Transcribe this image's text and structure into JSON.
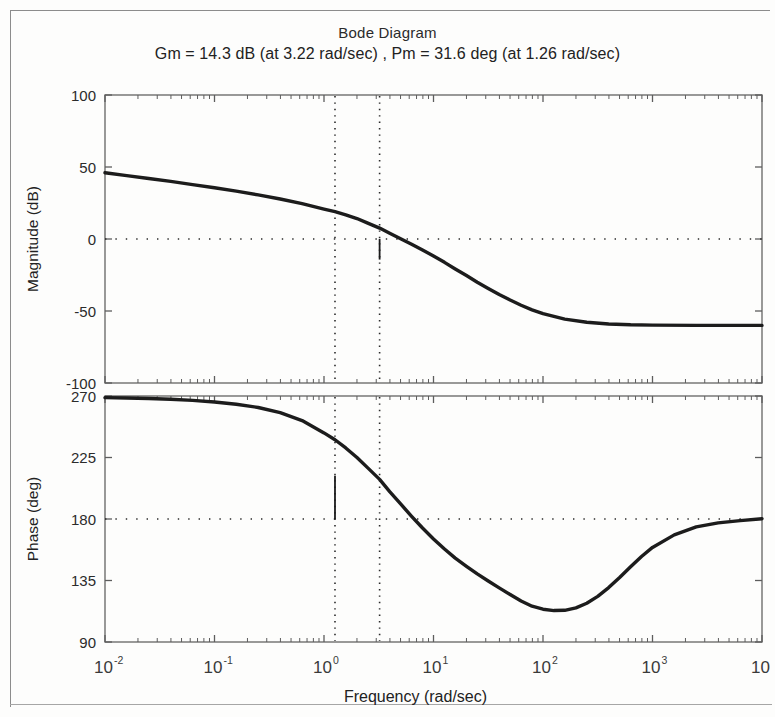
{
  "figure": {
    "title": "Bode Diagram",
    "subtitle": "Gm = 14.3 dB (at 3.22 rad/sec) ,  Pm = 31.6 deg (at 1.26 rad/sec)"
  },
  "margins": {
    "gain_margin_db": 14.3,
    "gain_margin_freq": 3.22,
    "phase_margin_deg": 31.6,
    "phase_margin_freq": 1.26,
    "gain_margin_label": "Gm = 14.3 dB (at 3.22 rad/sec)",
    "phase_margin_label": "Pm = 31.6 deg (at 1.26 rad/sec)"
  },
  "xaxis": {
    "label": "Frequency  (rad/sec)",
    "scale": "log",
    "range": [
      0.01,
      10000
    ],
    "tick_bases": [
      "10",
      "10",
      "10",
      "10",
      "10",
      "10",
      "10"
    ],
    "tick_exponents": [
      "-2",
      "-1",
      "0",
      "1",
      "2",
      "3",
      ""
    ],
    "tick_values": [
      0.01,
      0.1,
      1,
      10,
      100,
      1000,
      10000
    ]
  },
  "chart_data": {
    "type": "line",
    "title": "Bode Diagram",
    "subtitle": "Gm = 14.3 dB (at 3.22 rad/sec) ,  Pm = 31.6 deg (at 1.26 rad/sec)",
    "xlabel": "Frequency  (rad/sec)",
    "xscale": "log",
    "xlim": [
      0.01,
      10000
    ],
    "xticks": [
      0.01,
      0.1,
      1,
      10,
      100,
      1000,
      10000
    ],
    "grid": false,
    "legend": null,
    "panels": [
      {
        "name": "magnitude",
        "ylabel": "Magnitude (dB)",
        "ylim": [
          -100,
          100
        ],
        "yticks": [
          -100,
          -50,
          0,
          50,
          100
        ],
        "ytick_labels": [
          "-100",
          "-50",
          "0",
          "50",
          "100"
        ],
        "reference_line": {
          "y": 0,
          "style": "dotted"
        },
        "markers": [
          {
            "kind": "vertical-dotted",
            "x": 1.26,
            "note": "gain crossover (Pm freq)"
          },
          {
            "kind": "vertical-dotted",
            "x": 3.22,
            "note": "phase crossover (Gm freq)"
          },
          {
            "kind": "vertical-solid",
            "x": 3.22,
            "from": 0,
            "to": -14.3,
            "note": "gain margin bar"
          }
        ],
        "series": [
          {
            "name": "magnitude",
            "x": [
              0.01,
              0.0158,
              0.0251,
              0.0398,
              0.0631,
              0.1,
              0.158,
              0.251,
              0.398,
              0.631,
              1.0,
              1.26,
              1.58,
              2.0,
              2.51,
              3.22,
              3.98,
              5.01,
              6.31,
              7.94,
              10.0,
              12.6,
              15.8,
              20.0,
              25.1,
              31.6,
              39.8,
              50.1,
              63.1,
              79.4,
              100,
              158,
              251,
              398,
              631,
              1000,
              2510,
              10000
            ],
            "y": [
              46.0,
              44.0,
              42.0,
              40.0,
              37.8,
              35.6,
              33.2,
              30.6,
              27.8,
              24.6,
              20.8,
              19.0,
              16.8,
              14.2,
              11.0,
              7.6,
              4.0,
              0.2,
              -3.6,
              -7.6,
              -11.8,
              -16.2,
              -20.8,
              -25.4,
              -30.0,
              -34.4,
              -38.6,
              -42.4,
              -46.0,
              -49.2,
              -51.8,
              -55.6,
              -57.8,
              -59.0,
              -59.6,
              -59.8,
              -60.0,
              -60.0
            ]
          }
        ]
      },
      {
        "name": "phase",
        "ylabel": "Phase (deg)",
        "ylim": [
          90,
          270
        ],
        "yticks": [
          90,
          135,
          180,
          225,
          270
        ],
        "ytick_labels": [
          "90",
          "135",
          "180",
          "225",
          "270"
        ],
        "reference_line": {
          "y": 180,
          "style": "dotted"
        },
        "markers": [
          {
            "kind": "vertical-dotted",
            "x": 1.26,
            "note": "gain crossover (Pm freq)"
          },
          {
            "kind": "vertical-dotted",
            "x": 3.22,
            "note": "phase crossover (Gm freq)"
          },
          {
            "kind": "vertical-solid",
            "x": 1.26,
            "from": 211.6,
            "to": 180,
            "note": "phase margin bar"
          }
        ],
        "series": [
          {
            "name": "phase",
            "x": [
              0.01,
              0.0158,
              0.0251,
              0.0398,
              0.0631,
              0.1,
              0.158,
              0.251,
              0.398,
              0.631,
              1.0,
              1.26,
              1.58,
              2.0,
              2.51,
              3.22,
              3.98,
              5.01,
              6.31,
              7.94,
              10.0,
              12.6,
              15.8,
              20.0,
              25.1,
              31.6,
              39.8,
              50.1,
              63.1,
              79.4,
              100,
              126,
              158,
              200,
              251,
              316,
              398,
              501,
              631,
              794,
              1000,
              1580,
              2510,
              3980,
              6310,
              10000
            ],
            "y": [
              268.8,
              268.5,
              268.2,
              267.6,
              266.8,
              265.6,
              264.0,
              261.6,
              257.8,
              252.0,
              243.0,
              238.0,
              232.0,
              225.0,
              217.4,
              209.0,
              200.0,
              191.0,
              182.0,
              173.4,
              165.4,
              158.0,
              151.4,
              145.4,
              139.8,
              134.6,
              129.6,
              124.8,
              120.0,
              116.2,
              114.0,
              113.0,
              113.2,
              115.0,
              118.4,
              123.4,
              129.8,
              137.2,
              145.0,
              152.6,
              159.2,
              168.4,
              174.2,
              177.2,
              178.8,
              180.2
            ]
          }
        ]
      }
    ]
  }
}
